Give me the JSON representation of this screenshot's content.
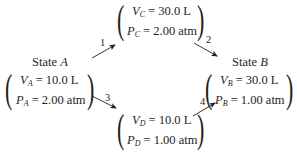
{
  "states": {
    "A": {
      "title_prefix": "State",
      "title_letter": "A",
      "V_sym": "V",
      "V_sub": "A",
      "V_val": "= 10.0 L",
      "P_sym": "P",
      "P_sub": "A",
      "P_val": "= 2.00 atm"
    },
    "B": {
      "title_prefix": "State",
      "title_letter": "B",
      "V_sym": "V",
      "V_sub": "B",
      "V_val": "= 30.0 L",
      "P_sym": "P",
      "P_sub": "B",
      "P_val": "= 1.00 atm"
    },
    "C": {
      "V_sym": "V",
      "V_sub": "C",
      "V_val": "= 30.0 L",
      "P_sym": "P",
      "P_sub": "C",
      "P_val": "= 2.00 atm"
    },
    "D": {
      "V_sym": "V",
      "V_sub": "D",
      "V_val": "= 10.0 L",
      "P_sym": "P",
      "P_sub": "D",
      "P_val": "= 1.00 atm"
    }
  },
  "steps": [
    {
      "label": "1",
      "from": "A",
      "to": "C"
    },
    {
      "label": "2",
      "from": "C",
      "to": "B"
    },
    {
      "label": "3",
      "from": "A",
      "to": "D"
    },
    {
      "label": "4",
      "from": "D",
      "to": "B"
    }
  ]
}
